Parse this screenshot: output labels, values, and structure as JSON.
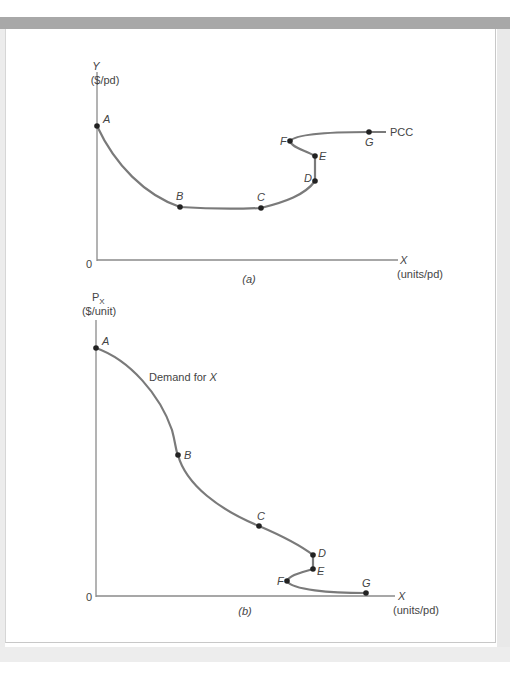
{
  "figure": {
    "panel_a": {
      "caption": "(a)",
      "y_axis_label": "Y",
      "y_axis_units": "($/pd)",
      "x_axis_label": "X",
      "x_axis_units": "(units/pd)",
      "origin_label": "0",
      "curve_label": "PCC",
      "points": [
        {
          "label": "A",
          "x": 97,
          "y": 126
        },
        {
          "label": "B",
          "x": 180,
          "y": 207
        },
        {
          "label": "C",
          "x": 261,
          "y": 208
        },
        {
          "label": "D",
          "x": 315,
          "y": 181
        },
        {
          "label": "E",
          "x": 315,
          "y": 156
        },
        {
          "label": "F",
          "x": 290,
          "y": 141
        },
        {
          "label": "G",
          "x": 369,
          "y": 132
        }
      ]
    },
    "panel_b": {
      "caption": "(b)",
      "y_axis_label": "P",
      "y_axis_subscript": "X",
      "y_axis_units": "($/unit)",
      "x_axis_label": "X",
      "x_axis_units": "(units/pd)",
      "origin_label": "0",
      "curve_label_prefix": "Demand for ",
      "curve_label_var": "X",
      "points": [
        {
          "label": "A",
          "x": 96,
          "y": 348
        },
        {
          "label": "B",
          "x": 178,
          "y": 455
        },
        {
          "label": "C",
          "x": 259,
          "y": 526
        },
        {
          "label": "D",
          "x": 313,
          "y": 555
        },
        {
          "label": "E",
          "x": 313,
          "y": 569
        },
        {
          "label": "F",
          "x": 287,
          "y": 581
        },
        {
          "label": "G",
          "x": 366,
          "y": 593
        }
      ]
    },
    "colors": {
      "curve": "#7a7a7a",
      "axis": "#8a8a8a",
      "point": "#222222",
      "text": "#444444",
      "frame_bar": "#a8a8a8"
    }
  }
}
